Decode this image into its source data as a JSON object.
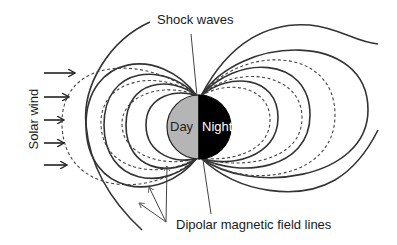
{
  "labels": {
    "shock_waves": "Shock waves",
    "solar_wind": "Solar wind",
    "day": "Day",
    "night": "Night",
    "dipolar_field_lines": "Dipolar magnetic field lines"
  },
  "colors": {
    "day_side": "#b5b5b5",
    "night_side": "#000000",
    "lines": "#333333",
    "background": "#ffffff"
  },
  "earth": {
    "cx": 199,
    "cy": 127,
    "r": 32
  },
  "solar_wind_arrows": {
    "count": 5,
    "y_positions": [
      73,
      97,
      120,
      143,
      165
    ]
  }
}
